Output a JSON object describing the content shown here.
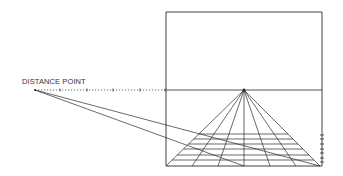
{
  "diagram": {
    "labels": {
      "distance_point": "DISTANCE POINT"
    },
    "frame": {
      "x1": 166,
      "y1": 12,
      "x2": 322,
      "y2": 166
    },
    "horizon_y": 90,
    "vanishing_point": {
      "x": 244,
      "y": 90
    },
    "distance_point": {
      "x": 35,
      "y": 90
    },
    "horizon_ticks_x": [
      60,
      87,
      113,
      140,
      165
    ],
    "base_points_x": [
      166,
      192,
      218,
      244,
      270,
      296,
      320
    ],
    "grid_rows_y": [
      134,
      139,
      144,
      149,
      155,
      160
    ],
    "right_edge_ticks_y": [
      135,
      139,
      144,
      149,
      153,
      158,
      162
    ],
    "diagonals": [
      {
        "from": [
          35,
          90
        ],
        "to": [
          320,
          166
        ]
      },
      {
        "from": [
          35,
          90
        ],
        "to": [
          244,
          166
        ]
      }
    ],
    "colors": {
      "line": "#2a2a2a",
      "background": "#ffffff"
    }
  }
}
